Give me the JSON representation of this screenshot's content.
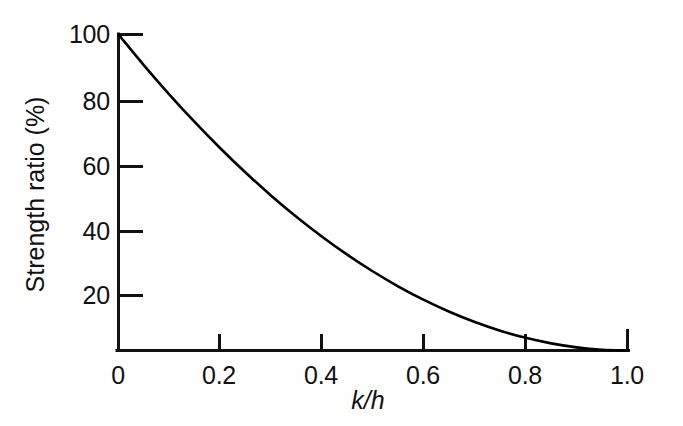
{
  "chart_data": {
    "type": "line",
    "title": "",
    "xlabel": "k/h",
    "ylabel": "Strength ratio (%)",
    "xlim": [
      0,
      1.0
    ],
    "ylim": [
      0,
      100
    ],
    "grid": false,
    "legend": null,
    "x_ticks": [
      "0",
      "0.2",
      "0.4",
      "0.6",
      "0.8",
      "1.0"
    ],
    "x_tick_values": [
      0,
      0.2,
      0.4,
      0.6,
      0.8,
      1.0
    ],
    "y_ticks": [
      "20",
      "40",
      "60",
      "80",
      "100"
    ],
    "y_tick_values": [
      20,
      40,
      60,
      80,
      100
    ],
    "series": [
      {
        "name": "Strength ratio",
        "color": "#000000",
        "x": [
          0.0,
          0.05,
          0.1,
          0.15,
          0.2,
          0.25,
          0.3,
          0.35,
          0.4,
          0.45,
          0.5,
          0.55,
          0.6,
          0.65,
          0.7,
          0.75,
          0.8,
          0.85,
          0.9,
          0.95,
          1.0
        ],
        "y": [
          100.0,
          90.25,
          81.0,
          72.25,
          64.0,
          56.25,
          49.0,
          42.25,
          36.0,
          30.25,
          25.0,
          20.25,
          16.0,
          12.25,
          9.0,
          6.25,
          4.0,
          2.25,
          1.0,
          0.25,
          0.0
        ]
      }
    ]
  },
  "axes": {
    "line_color": "#111111",
    "curve_color": "#111111",
    "spines": "left-bottom",
    "tick_direction_y": "inward",
    "tick_direction_x": "outward-up"
  },
  "labels": {
    "y_axis_title": "Strength ratio (%)",
    "x_axis_title": "k/h",
    "y_tick_100": "100",
    "y_tick_80": "80",
    "y_tick_60": "60",
    "y_tick_40": "40",
    "y_tick_20": "20",
    "x_tick_0": "0",
    "x_tick_02": "0.2",
    "x_tick_04": "0.4",
    "x_tick_06": "0.6",
    "x_tick_08": "0.8",
    "x_tick_10": "1.0"
  }
}
